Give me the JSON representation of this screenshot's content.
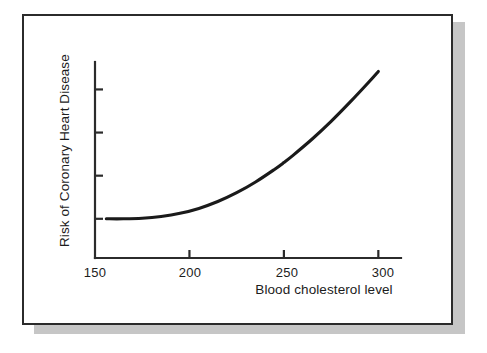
{
  "figure": {
    "background_color": "#ffffff",
    "frame_color": "#2b2b2b",
    "shadow_color": "#c6c6c6",
    "curve_color": "#1a1a1a",
    "axis_color": "#2b2b2b"
  },
  "chart_data": {
    "type": "line",
    "title": "",
    "subtitle": "",
    "xlabel": "Blood cholesterol level",
    "ylabel": "Risk of Coronary Heart Disease",
    "xlim": [
      150,
      312
    ],
    "ylim": [
      0,
      1
    ],
    "grid": false,
    "legend": false,
    "legend_position": "none",
    "x_ticks": [
      150,
      200,
      250,
      300
    ],
    "x_tick_labels": [
      "150",
      "200",
      "250",
      "300"
    ],
    "y_ticks": [
      0.2,
      0.42,
      0.64,
      0.86
    ],
    "y_tick_labels": [
      "",
      "",
      "",
      ""
    ],
    "annotations": [],
    "series": [
      {
        "name": "Risk of coronary heart disease",
        "x": [
          156,
          165,
          175,
          185,
          195,
          205,
          215,
          225,
          235,
          245,
          250,
          255,
          265,
          275,
          285,
          295,
          300
        ],
        "y": [
          0.2,
          0.2,
          0.203,
          0.212,
          0.228,
          0.253,
          0.288,
          0.333,
          0.388,
          0.452,
          0.487,
          0.525,
          0.607,
          0.697,
          0.795,
          0.898,
          0.952
        ]
      }
    ]
  },
  "labels": {
    "x_axis_title": "Blood cholesterol level",
    "y_axis_title": "Risk of Coronary Heart Disease",
    "x_tick_150": "150",
    "x_tick_200": "200",
    "x_tick_250": "250",
    "x_tick_300": "300"
  }
}
